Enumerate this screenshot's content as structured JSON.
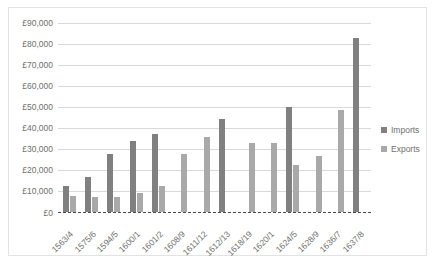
{
  "chart_data": {
    "type": "bar",
    "title": "",
    "xlabel": "",
    "ylabel": "",
    "ylim": [
      0,
      90000
    ],
    "ytick_step": 10000,
    "grid": true,
    "legend_position": "right",
    "currency_symbol": "£",
    "categories": [
      "1563/4",
      "1575/6",
      "1594/5",
      "1600/1",
      "1601/2",
      "1608/9",
      "1611/12",
      "1612/13",
      "1618/19",
      "1620/1",
      "1624/5",
      "1628/9",
      "1636/7",
      "1637/8"
    ],
    "ytick_labels": [
      "£90,000",
      "£80,000",
      "£70,000",
      "£60,000",
      "£50,000",
      "£40,000",
      "£30,000",
      "£20,000",
      "£10,000",
      "£0"
    ],
    "ytick_values": [
      90000,
      80000,
      70000,
      60000,
      50000,
      40000,
      30000,
      20000,
      10000,
      0
    ],
    "series": [
      {
        "name": "Imports",
        "color": "#808080",
        "values": [
          12500,
          16500,
          27800,
          34000,
          37000,
          null,
          null,
          44500,
          null,
          null,
          50000,
          null,
          null,
          83000
        ]
      },
      {
        "name": "Exports",
        "color": "#a9a9a9",
        "values": [
          7500,
          7000,
          7000,
          9000,
          12500,
          27500,
          35500,
          null,
          33000,
          33000,
          22500,
          26500,
          48500,
          null
        ]
      }
    ]
  },
  "legend": {
    "items": [
      {
        "label": "Imports",
        "color": "#808080"
      },
      {
        "label": "Exports",
        "color": "#a9a9a9"
      }
    ]
  }
}
